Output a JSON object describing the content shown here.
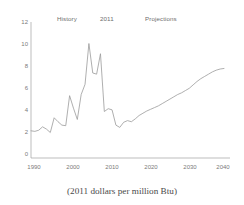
{
  "chart_data": {
    "type": "line",
    "title": "",
    "subtitle": "",
    "caption": "(2011 dollars per million Btu)",
    "xlabel": "",
    "ylabel": "",
    "xlim": [
      1990,
      2040
    ],
    "ylim": [
      0,
      12
    ],
    "grid": false,
    "legend_position": "none",
    "line_color": "#9a9a9a",
    "axis_color": "#9a9a9a",
    "text_color": "#6e6e6e",
    "xticks": [
      "1990",
      "2000",
      "2010",
      "2020",
      "2030",
      "2040"
    ],
    "xtick_values": [
      1990,
      2000,
      2010,
      2020,
      2030,
      2040
    ],
    "yticks": [
      "0",
      "2",
      "4",
      "6",
      "8",
      "10",
      "12"
    ],
    "ytick_values": [
      0,
      2,
      4,
      6,
      8,
      10,
      12
    ],
    "annotations": [
      {
        "name": "history",
        "text": "History",
        "x": 1996
      },
      {
        "name": "divider-year",
        "text": "2011",
        "x": 2011
      },
      {
        "name": "projections",
        "text": "Projections",
        "x": 2022
      }
    ],
    "series": [
      {
        "name": "natural gas price",
        "x": [
          1990,
          1991,
          1992,
          1993,
          1994,
          1995,
          1996,
          1997,
          1998,
          1999,
          2000,
          2001,
          2002,
          2003,
          2004,
          2005,
          2006,
          2007,
          2008,
          2009,
          2010,
          2011,
          2012,
          2013,
          2014,
          2015,
          2016,
          2017,
          2018,
          2019,
          2020,
          2021,
          2022,
          2023,
          2024,
          2025,
          2026,
          2027,
          2028,
          2029,
          2030,
          2031,
          2032,
          2033,
          2034,
          2035,
          2036,
          2037,
          2038,
          2039,
          2040
        ],
        "values": [
          2.4,
          2.35,
          2.45,
          2.75,
          2.55,
          2.25,
          3.55,
          3.2,
          2.9,
          2.85,
          5.5,
          4.4,
          3.4,
          5.6,
          6.5,
          10.1,
          7.5,
          7.4,
          9.2,
          4.1,
          4.35,
          4.25,
          2.9,
          2.7,
          3.15,
          3.3,
          3.2,
          3.45,
          3.75,
          3.95,
          4.15,
          4.3,
          4.45,
          4.6,
          4.8,
          5.0,
          5.2,
          5.4,
          5.6,
          5.75,
          5.95,
          6.15,
          6.45,
          6.75,
          7.0,
          7.2,
          7.4,
          7.6,
          7.75,
          7.85,
          7.9
        ]
      }
    ]
  }
}
